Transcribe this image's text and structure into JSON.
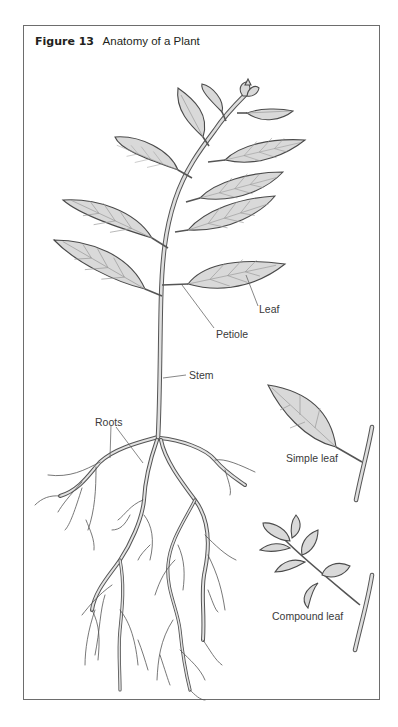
{
  "figure": {
    "number_label": "Figure 13",
    "title": "Anatomy of a Plant"
  },
  "labels": {
    "leaf": "Leaf",
    "petiole": "Petiole",
    "stem": "Stem",
    "roots": "Roots",
    "simple_leaf": "Simple leaf",
    "compound_leaf": "Compound leaf"
  },
  "colors": {
    "leaf_fill": "#d9d9d9",
    "outline": "#4a4a4a",
    "frame": "#6d6d6d",
    "text": "#231f20"
  }
}
